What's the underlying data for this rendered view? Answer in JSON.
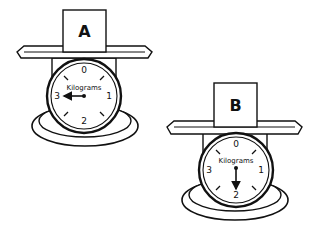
{
  "diagram": {
    "scales": [
      {
        "id": "A",
        "box_label": "A",
        "unit_label": "Kilograms",
        "dial_numbers": [
          "0",
          "1",
          "2",
          "3"
        ],
        "reading_kg": 3,
        "needle_direction": "left"
      },
      {
        "id": "B",
        "box_label": "B",
        "unit_label": "Kilograms",
        "dial_numbers": [
          "0",
          "1",
          "2",
          "3"
        ],
        "reading_kg": 2,
        "needle_direction": "down"
      }
    ]
  },
  "colors": {
    "stroke": "#111111",
    "fill": "#ffffff"
  }
}
